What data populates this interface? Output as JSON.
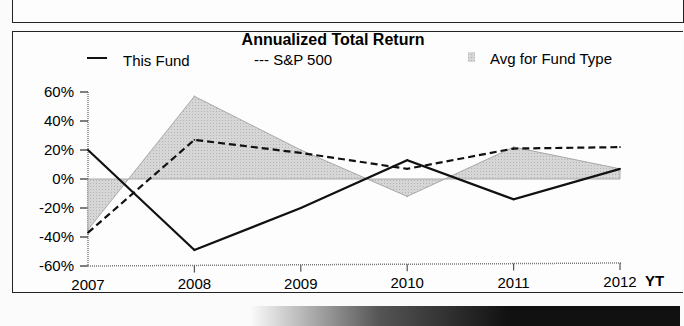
{
  "chart_data": {
    "type": "line",
    "title": "Annualized Total Return",
    "xlabel": "",
    "ylabel": "",
    "categories": [
      "2007",
      "2008",
      "2009",
      "2010",
      "2011",
      "2012"
    ],
    "trailing_label": "YT",
    "ylim": [
      -60,
      60
    ],
    "yticks": [
      60,
      40,
      20,
      0,
      -20,
      -40,
      -60
    ],
    "ytick_labels": [
      "60%",
      "40%",
      "20%",
      "0%",
      "-20%",
      "-40%",
      "-60%"
    ],
    "grid": false,
    "legend_position": "top",
    "series": [
      {
        "name": "This Fund",
        "legend_label": "This Fund",
        "style": "solid",
        "values": [
          20,
          -49,
          -20,
          13,
          -14,
          7
        ]
      },
      {
        "name": "S&P 500",
        "legend_label": "--- S&P 500",
        "style": "dashed",
        "values": [
          -37,
          27,
          18,
          7,
          21,
          22
        ]
      },
      {
        "name": "Avg for Fund Type",
        "legend_label": "Avg for Fund Type",
        "style": "area",
        "values": [
          -35,
          57,
          20,
          -12,
          22,
          7
        ]
      }
    ]
  },
  "colors": {
    "line": "#111111",
    "area_fill": "#d2d2d2",
    "area_edge": "#a8a8a8",
    "axis": "#777777"
  }
}
